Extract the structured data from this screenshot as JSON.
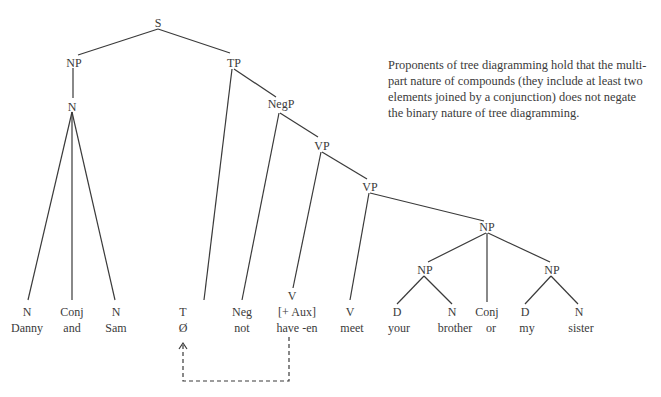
{
  "caption": {
    "lines": [
      "Proponents of tree diagramming hold that the multi-",
      "part nature of compounds (they include at least two",
      "elements joined by a conjunction) does not negate",
      "the binary nature of tree diagramming."
    ]
  },
  "tree": {
    "nodes": {
      "S": "S",
      "NP_subject": "NP",
      "N_subject": "N",
      "TP": "TP",
      "NegP": "NegP",
      "VP_upper": "VP",
      "VP_lower": "VP",
      "NP_object": "NP",
      "NP_object_left": "NP",
      "NP_object_right": "NP"
    },
    "leaves": [
      {
        "cat": "N",
        "word": "Danny"
      },
      {
        "cat": "Conj",
        "word": "and"
      },
      {
        "cat": "N",
        "word": "Sam"
      },
      {
        "cat": "T",
        "word": "Ø"
      },
      {
        "cat": "Neg",
        "word": "not"
      },
      {
        "cat": "V",
        "feature": "[+ Aux]",
        "word": "have -en"
      },
      {
        "cat": "V",
        "word": "meet"
      },
      {
        "cat": "D",
        "word": "your"
      },
      {
        "cat": "N",
        "word": "brother"
      },
      {
        "cat": "Conj",
        "word": "or"
      },
      {
        "cat": "D",
        "word": "my"
      },
      {
        "cat": "N",
        "word": "sister"
      }
    ],
    "movement_arrow": {
      "from": "have -en",
      "to": "Ø",
      "style": "dashed"
    }
  }
}
